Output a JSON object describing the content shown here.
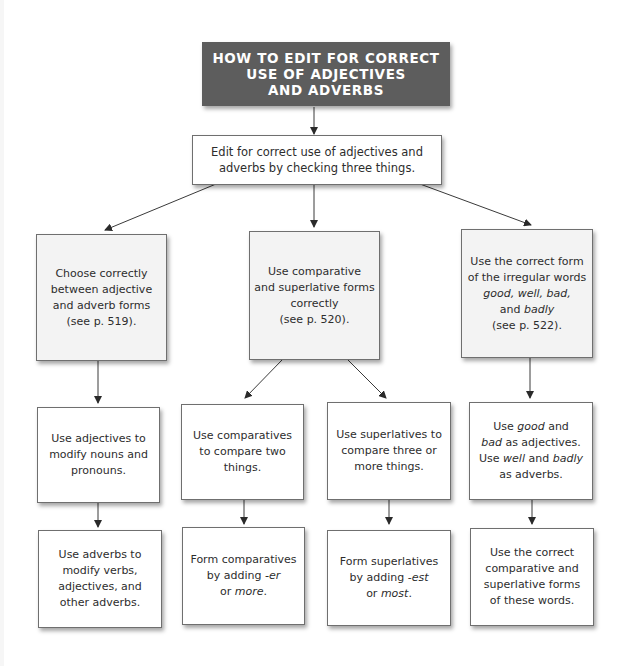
{
  "title": {
    "lines": [
      "HOW TO EDIT FOR CORRECT",
      "USE OF ADJECTIVES",
      "AND ADVERBS"
    ]
  },
  "intro": {
    "lines": [
      "Edit for correct use of adjectives and",
      "adverbs by checking three things."
    ]
  },
  "branches": [
    {
      "main": {
        "lines": [
          "Choose correctly",
          "between adjective",
          "and adverb forms",
          "(see p. 519)."
        ]
      },
      "steps": [
        {
          "lines": [
            "Use adjectives to",
            "modify nouns and",
            "pronouns."
          ]
        },
        {
          "lines": [
            "Use adverbs to",
            "modify verbs,",
            "adjectives, and",
            "other adverbs."
          ]
        }
      ]
    },
    {
      "main": {
        "lines": [
          "Use comparative",
          "and superlative forms",
          "correctly",
          "(see p. 520)."
        ]
      },
      "sub_branches": [
        {
          "steps": [
            {
              "lines": [
                "Use comparatives",
                "to compare two",
                "things."
              ]
            },
            {
              "lines": [
                "Form comparatives",
                "by adding -er",
                "or more."
              ]
            }
          ]
        },
        {
          "steps": [
            {
              "lines": [
                "Use superlatives to",
                "compare three or",
                "more things."
              ]
            },
            {
              "lines": [
                "Form superlatives",
                "by adding -est",
                "or most."
              ]
            }
          ]
        }
      ]
    },
    {
      "main": {
        "lines": [
          "Use the correct form",
          "of the irregular words",
          "good, well, bad,",
          "and badly",
          "(see p. 522)."
        ]
      },
      "steps": [
        {
          "lines": [
            "Use good and",
            "bad as adjectives.",
            "Use well and badly",
            "as adverbs."
          ]
        },
        {
          "lines": [
            "Use the correct",
            "comparative and",
            "superlative forms",
            "of these words."
          ]
        }
      ]
    }
  ],
  "colors": {
    "title_bg": "#5d5d5d",
    "title_text": "#ffffff",
    "main_box_bg": "#f3f3f3",
    "step_box_bg": "#ffffff",
    "border": "#6f6f6f",
    "arrow": "#2a2a2a"
  }
}
